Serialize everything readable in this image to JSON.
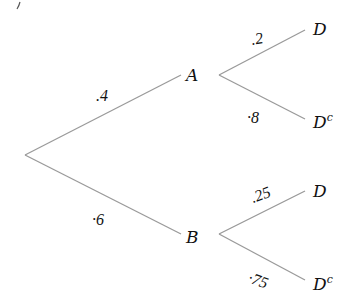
{
  "diagram": {
    "type": "probability-tree",
    "root": {
      "x": 25,
      "y": 155
    },
    "first_level": [
      {
        "node": "A",
        "probability": ".4",
        "end": {
          "x": 181,
          "y": 75
        },
        "label_pos": {
          "x": 186,
          "y": 81
        },
        "prob_pos": {
          "x": 96,
          "y": 101
        },
        "branch_point": {
          "x": 219,
          "y": 75
        }
      },
      {
        "node": "B",
        "probability": "·6",
        "end": {
          "x": 181,
          "y": 234
        },
        "label_pos": {
          "x": 186,
          "y": 243
        },
        "prob_pos": {
          "x": 92,
          "y": 225
        },
        "branch_point": {
          "x": 219,
          "y": 234
        }
      }
    ],
    "second_level": {
      "A": [
        {
          "outcome": "D",
          "sup": "",
          "probability": ".2",
          "end": {
            "x": 305,
            "y": 30
          },
          "label_pos": {
            "x": 313,
            "y": 35
          },
          "prob_pos": {
            "x": 252,
            "y": 45
          }
        },
        {
          "outcome": "D",
          "sup": "c",
          "probability": "·8",
          "end": {
            "x": 305,
            "y": 119
          },
          "label_pos": {
            "x": 313,
            "y": 128
          },
          "prob_pos": {
            "x": 247,
            "y": 123
          }
        }
      ],
      "B": [
        {
          "outcome": "D",
          "sup": "",
          "probability": ".25",
          "end": {
            "x": 305,
            "y": 191
          },
          "label_pos": {
            "x": 313,
            "y": 197
          },
          "prob_pos": {
            "x": 253,
            "y": 203
          }
        },
        {
          "outcome": "D",
          "sup": "c",
          "probability": "·75",
          "end": {
            "x": 305,
            "y": 280
          },
          "label_pos": {
            "x": 313,
            "y": 290
          },
          "prob_pos": {
            "x": 247,
            "y": 282
          }
        }
      ]
    }
  },
  "colors": {
    "edge": "#9a9a9a",
    "text": "#111111",
    "background": "#ffffff"
  }
}
